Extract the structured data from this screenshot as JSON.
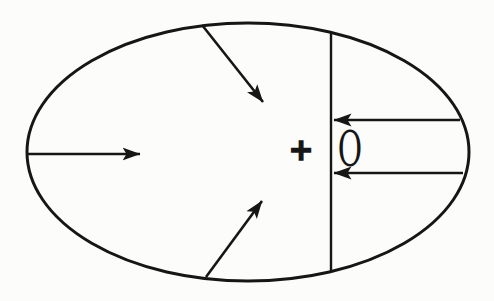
{
  "figure": {
    "canvas": {
      "width": 494,
      "height": 301
    },
    "colors": {
      "ink": "#161616",
      "paper": "#fcfcfa"
    },
    "labels": {
      "origin_marker": "+",
      "origin": "O"
    },
    "ellipse": {
      "cx": 248,
      "cy": 152,
      "rx": 221,
      "ry": 129,
      "stroke_width": 3
    },
    "chord": {
      "x": 331,
      "stroke_width": 2.4
    },
    "arrow_stroke_width": 2.6,
    "arrows": [
      {
        "name": "arrow-left-rightward",
        "x1": 27,
        "y1": 154,
        "x2": 140,
        "y2": 154
      },
      {
        "name": "arrow-top-inward",
        "x1": 202,
        "y1": 25,
        "x2": 263,
        "y2": 102
      },
      {
        "name": "arrow-bottom-inward",
        "x1": 206,
        "y1": 277,
        "x2": 262,
        "y2": 201
      },
      {
        "name": "arrow-right-upper-leftward",
        "x1": 460,
        "y1": 120,
        "x2": 334,
        "y2": 120
      },
      {
        "name": "arrow-right-lower-leftward",
        "x1": 463,
        "y1": 173,
        "x2": 334,
        "y2": 173
      }
    ],
    "marker_pos": {
      "x": 301,
      "y": 149
    },
    "origin_pos": {
      "x": 350,
      "y": 149
    }
  }
}
